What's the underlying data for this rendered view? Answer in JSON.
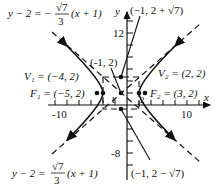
{
  "figure": {
    "equation_hint": "(x+1)^2/9 - (y-2)^2/7 = 1",
    "axes": {
      "x_label": "x",
      "y_label": "y",
      "x_tick_labels": [
        "-10",
        "10"
      ],
      "y_tick_labels": [
        "12",
        "-8"
      ],
      "x_range": [
        -12,
        14
      ],
      "y_range": [
        -9,
        16
      ],
      "minor_ticks_every": 2
    },
    "points": {
      "center": {
        "label": "(-1, 2)",
        "x": -1,
        "y": 2
      },
      "vertex1": {
        "label": "V₁ = (−4, 2)",
        "name": "V1",
        "x": -4,
        "y": 2
      },
      "vertex2": {
        "label": "V₂ = (2, 2)",
        "name": "V2",
        "x": 2,
        "y": 2
      },
      "focus1": {
        "label": "F₁ = (−5, 2)",
        "name": "F1",
        "x": -5,
        "y": 2
      },
      "focus2": {
        "label": "F₂ = (3, 2)",
        "name": "F2",
        "x": 3,
        "y": 2
      },
      "conj_top": {
        "label": "(−1, 2 + √7)",
        "x": -1,
        "y": 4.6458
      },
      "conj_bottom": {
        "label": "(−1, 2 − √7)",
        "x": -1,
        "y": -0.6458
      }
    },
    "asymptotes": {
      "upper_left": {
        "lhs": "y − 2 = −",
        "num": "√7",
        "den": "3",
        "rhs": "(x + 1)"
      },
      "lower_left": {
        "lhs": "y − 2 = ",
        "num": "√7",
        "den": "3",
        "rhs": "(x + 1)"
      }
    },
    "small_labels": {
      "one_x": "1",
      "two_x": "2"
    },
    "colors": {
      "ink": "#111111",
      "background": "#ffffff"
    }
  }
}
